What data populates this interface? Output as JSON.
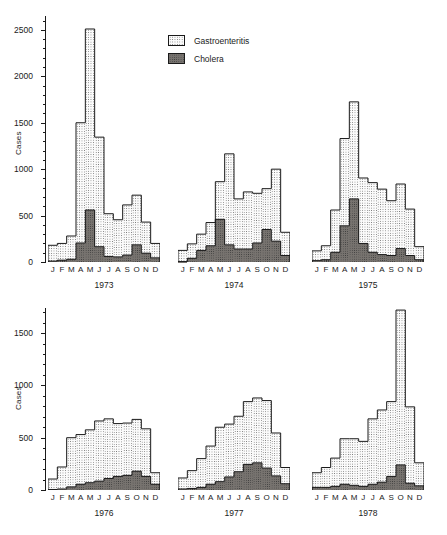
{
  "chart_data": {
    "type": "bar",
    "title": "",
    "subtitle": "",
    "ylabel": "Cases",
    "xlabel": "",
    "grid": false,
    "legend_position": "top-center",
    "stacked": true,
    "categories": [
      "J",
      "F",
      "M",
      "A",
      "M",
      "J",
      "J",
      "A",
      "S",
      "O",
      "N",
      "D"
    ],
    "legend": [
      {
        "name": "Gastroenteritis",
        "fill": "light-dotted",
        "color": "#fbfbfb"
      },
      {
        "name": "Cholera",
        "fill": "dark-dotted",
        "color": "#77736f"
      }
    ],
    "rows": [
      {
        "row_label": "top-row",
        "ylim": [
          0,
          2650
        ],
        "yticks": [
          0,
          500,
          1000,
          1500,
          2000,
          2500
        ],
        "ytick_labels": [
          "0",
          "500",
          "1000",
          "1500",
          "2000",
          "2500"
        ],
        "ylabel": "Cases",
        "panels": [
          {
            "year": "1973",
            "series": [
              {
                "name": "Cholera",
                "values": [
                  10,
                  20,
                  30,
                  205,
                  560,
                  165,
                  60,
                  55,
                  75,
                  185,
                  95,
                  45
                ]
              },
              {
                "name": "Gastroenteritis",
                "values": [
                  180,
                  200,
                  280,
                  1500,
                  2510,
                  1345,
                  520,
                  455,
                  615,
                  720,
                  430,
                  200
                ]
              }
            ]
          },
          {
            "year": "1974",
            "series": [
              {
                "name": "Cholera",
                "values": [
                  5,
                  40,
                  125,
                  175,
                  460,
                  185,
                  140,
                  140,
                  205,
                  350,
                  225,
                  70
                ]
              },
              {
                "name": "Gastroenteritis",
                "values": [
                  125,
                  195,
                  300,
                  425,
                  865,
                  1165,
                  680,
                  755,
                  740,
                  790,
                  1000,
                  320
                ]
              }
            ]
          },
          {
            "year": "1975",
            "series": [
              {
                "name": "Cholera",
                "values": [
                  15,
                  25,
                  105,
                  390,
                  680,
                  200,
                  105,
                  80,
                  70,
                  145,
                  70,
                  25
                ]
              },
              {
                "name": "Gastroenteritis",
                "values": [
                  120,
                  175,
                  560,
                  1330,
                  1725,
                  905,
                  855,
                  785,
                  660,
                  840,
                  570,
                  165
                ]
              }
            ]
          }
        ]
      },
      {
        "row_label": "bottom-row",
        "ylim": [
          0,
          1740
        ],
        "yticks": [
          0,
          500,
          1000,
          1500
        ],
        "ytick_labels": [
          "0",
          "500",
          "1000",
          "1500"
        ],
        "ylabel": "Cases",
        "panels": [
          {
            "year": "1976",
            "series": [
              {
                "name": "Cholera",
                "values": [
                  5,
                  10,
                  30,
                  55,
                  70,
                  85,
                  110,
                  130,
                  140,
                  180,
                  130,
                  55
                ]
              },
              {
                "name": "Gastroenteritis",
                "values": [
                  105,
                  220,
                  500,
                  530,
                  575,
                  660,
                  680,
                  635,
                  640,
                  675,
                  585,
                  165
                ]
              }
            ]
          },
          {
            "year": "1977",
            "series": [
              {
                "name": "Cholera",
                "values": [
                  10,
                  15,
                  25,
                  55,
                  80,
                  125,
                  175,
                  245,
                  260,
                  210,
                  135,
                  60
                ]
              },
              {
                "name": "Gastroenteritis",
                "values": [
                  115,
                  185,
                  300,
                  420,
                  600,
                  630,
                  705,
                  845,
                  880,
                  855,
                  545,
                  215
                ]
              }
            ]
          },
          {
            "year": "1978",
            "series": [
              {
                "name": "Cholera",
                "values": [
                  25,
                  25,
                  35,
                  55,
                  45,
                  35,
                  55,
                  75,
                  130,
                  240,
                  65,
                  40
                ]
              },
              {
                "name": "Gastroenteritis",
                "values": [
                  165,
                  215,
                  305,
                  490,
                  490,
                  465,
                  680,
                  765,
                  845,
                  1720,
                  795,
                  260
                ]
              }
            ]
          }
        ]
      }
    ]
  }
}
